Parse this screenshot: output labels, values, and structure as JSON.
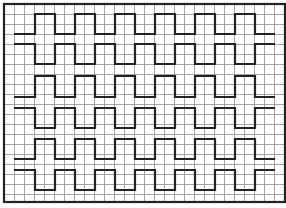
{
  "figure": {
    "background": "#ffffff",
    "grid": {
      "origin_x": 4,
      "origin_y": 4,
      "width": 281,
      "height": 198,
      "pitch": 10,
      "line_color": "#9a9a9a",
      "frame_color": "#222222"
    },
    "wave_style": {
      "stroke": "#222222",
      "stroke_width": 2.2
    },
    "wave_x": {
      "start": 14,
      "end": 275,
      "first_edge": 35,
      "half_period": 20
    },
    "waves": [
      {
        "id": "A1",
        "start_level": "low",
        "high_y": 14,
        "low_y": 34
      },
      {
        "id": "B1",
        "start_level": "high",
        "high_y": 44,
        "low_y": 64
      },
      {
        "id": "A2",
        "start_level": "low",
        "high_y": 76,
        "low_y": 97
      },
      {
        "id": "B2",
        "start_level": "high",
        "high_y": 108,
        "low_y": 128
      },
      {
        "id": "A3",
        "start_level": "low",
        "high_y": 139,
        "low_y": 159
      },
      {
        "id": "B3",
        "start_level": "high",
        "high_y": 170,
        "low_y": 190
      }
    ]
  }
}
